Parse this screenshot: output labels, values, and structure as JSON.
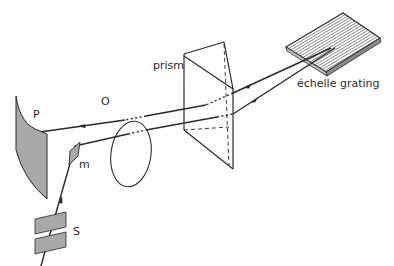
{
  "figure": {
    "labels": {
      "prism": "prism",
      "grating": "échelle grating",
      "lens": "O",
      "plate": "P",
      "mirror": "m",
      "slit": "S"
    },
    "colors": {
      "line": "#2a2a2a",
      "fill_gray": "#a9a9a9",
      "background": "#ffffff"
    }
  }
}
